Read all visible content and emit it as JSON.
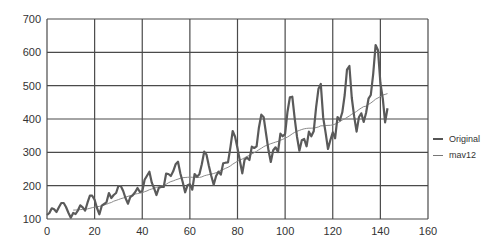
{
  "chart_data": {
    "type": "line",
    "title": "",
    "xlabel": "",
    "ylabel": "",
    "xlim": [
      0,
      160
    ],
    "ylim": [
      100,
      700
    ],
    "x_ticks": [
      0,
      20,
      40,
      60,
      80,
      100,
      120,
      140,
      160
    ],
    "y_ticks": [
      100,
      200,
      300,
      400,
      500,
      600,
      700
    ],
    "grid": true,
    "legend_position": "right",
    "series": [
      {
        "name": "Original",
        "color": "#555555",
        "line_width": 2,
        "x_start": 0,
        "values": [
          112,
          118,
          132,
          129,
          121,
          135,
          148,
          148,
          136,
          119,
          104,
          118,
          115,
          126,
          141,
          135,
          125,
          149,
          170,
          170,
          158,
          133,
          114,
          140,
          145,
          150,
          178,
          163,
          172,
          178,
          199,
          199,
          184,
          162,
          146,
          166,
          171,
          180,
          193,
          181,
          183,
          218,
          230,
          242,
          209,
          191,
          172,
          194,
          196,
          196,
          236,
          235,
          229,
          243,
          264,
          272,
          237,
          211,
          180,
          201,
          204,
          188,
          235,
          227,
          234,
          264,
          302,
          293,
          259,
          229,
          203,
          229,
          242,
          233,
          267,
          269,
          270,
          315,
          364,
          347,
          312,
          274,
          237,
          278,
          284,
          277,
          317,
          313,
          318,
          374,
          413,
          405,
          355,
          306,
          271,
          306,
          315,
          301,
          356,
          348,
          355,
          422,
          465,
          467,
          404,
          347,
          305,
          336,
          340,
          318,
          362,
          348,
          363,
          435,
          491,
          505,
          404,
          359,
          310,
          337,
          360,
          342,
          406,
          396,
          420,
          472,
          548,
          559,
          463,
          407,
          362,
          405,
          417,
          391,
          419,
          461,
          472,
          535,
          622,
          606,
          508,
          461,
          390,
          432
        ]
      },
      {
        "name": "mav12",
        "color": "#888888",
        "line_width": 1,
        "x_start": 11,
        "method": "trailing 12-point moving average of Original",
        "values": []
      }
    ]
  },
  "legend": {
    "items": [
      {
        "label": "Original"
      },
      {
        "label": "mav12"
      }
    ]
  }
}
